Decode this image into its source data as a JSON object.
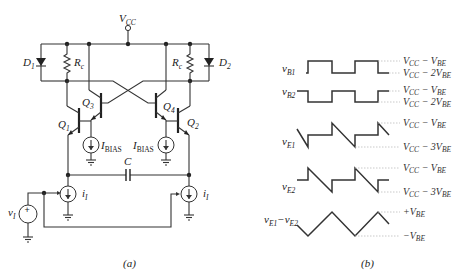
{
  "figure_a": {
    "caption": "(a)",
    "supply": "V",
    "supply_sub": "CC",
    "diode_left": "D",
    "diode_left_sub": "1",
    "diode_right": "D",
    "diode_right_sub": "2",
    "resistor_left": "R",
    "resistor_left_sub": "c",
    "resistor_right": "R",
    "resistor_right_sub": "c",
    "q1": "Q",
    "q1_sub": "1",
    "q2": "Q",
    "q2_sub": "2",
    "q3": "Q",
    "q3_sub": "3",
    "q4": "Q",
    "q4_sub": "4",
    "ibias_left": "I",
    "ibias_left_sub": "BIAS",
    "ibias_right": "I",
    "ibias_right_sub": "BIAS",
    "capacitor": "C",
    "source_left": "i",
    "source_left_sub": "I",
    "source_right": "i",
    "source_right_sub": "I",
    "input": "v",
    "input_sub": "I",
    "plus_sign": "+"
  },
  "figure_b": {
    "caption": "(b)",
    "waves": [
      {
        "name": "v",
        "sub": "B1",
        "levels": [
          "VCC − VBE",
          "VCC − 2VBE"
        ]
      },
      {
        "name": "v",
        "sub": "B2",
        "levels": [
          "VCC − VBE",
          "VCC − 2VBE"
        ]
      },
      {
        "name": "v",
        "sub": "E1",
        "levels": [
          "VCC − VBE",
          "VCC − 3VBE"
        ]
      },
      {
        "name": "v",
        "sub": "E2",
        "levels": [
          "VCC − VBE",
          "VCC − 3VBE"
        ]
      },
      {
        "name": "v",
        "sub": "E1",
        "name2": "−v",
        "sub2": "E2",
        "levels": [
          "+VBE",
          "−VBE"
        ]
      }
    ],
    "level_labels": {
      "l1a": "V",
      "l1a_s": "CC",
      "l1a_m": " − V",
      "l1a_s2": "BE",
      "l1b": "V",
      "l1b_s": "CC",
      "l1b_m": " − 2V",
      "l1b_s2": "BE",
      "l2a": "V",
      "l2a_s": "CC",
      "l2a_m": " − V",
      "l2a_s2": "BE",
      "l2b": "V",
      "l2b_s": "CC",
      "l2b_m": " − 2V",
      "l2b_s2": "BE",
      "l3a": "V",
      "l3a_s": "CC",
      "l3a_m": " − V",
      "l3a_s2": "BE",
      "l3b": "V",
      "l3b_s": "CC",
      "l3b_m": " − 3V",
      "l3b_s2": "BE",
      "l4a": "V",
      "l4a_s": "CC",
      "l4a_m": " − V",
      "l4a_s2": "BE",
      "l4b": "V",
      "l4b_s": "CC",
      "l4b_m": " − 3V",
      "l4b_s2": "BE",
      "l5a": "+V",
      "l5a_s": "BE",
      "l5b": "−V",
      "l5b_s": "BE"
    },
    "wave_labels": {
      "b1": "v",
      "b1_s": "B1",
      "b2": "v",
      "b2_s": "B2",
      "e1": "v",
      "e1_s": "E1",
      "e2": "v",
      "e2_s": "E2",
      "d1": "v",
      "d1_s": "E1",
      "d2": "−v",
      "d2_s": "E2"
    }
  }
}
